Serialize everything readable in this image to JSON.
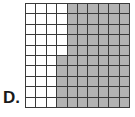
{
  "figure": {
    "label": "D.",
    "grid": {
      "rows": 10,
      "cols": 10,
      "shaded_color": "#b3b3b3",
      "unshaded_color": "#ffffff",
      "line_color": "#3a3a3a",
      "white_columns_per_row": [
        4,
        4,
        4,
        4,
        4,
        3,
        3,
        3,
        3,
        3
      ],
      "shaded_columns_per_row": [
        6,
        6,
        6,
        6,
        6,
        7,
        7,
        7,
        7,
        7
      ],
      "shaded_total": 65,
      "total_cells": 100
    }
  }
}
